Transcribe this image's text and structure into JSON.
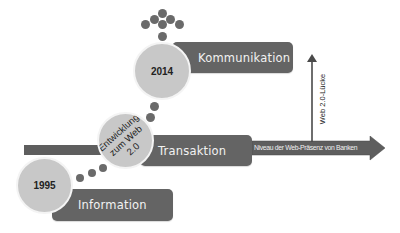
{
  "diagram": {
    "stages": [
      {
        "year": "1995",
        "label": "Information"
      },
      {
        "year": "",
        "label": "Transaktion",
        "circle_text_line1": "Entwicklung",
        "circle_text_line2": "zum Web 2.0"
      },
      {
        "year": "2014",
        "label": "Kommunikation"
      }
    ],
    "horizontal_arrow_label": "Niveau der Web-Präsenz von Banken",
    "vertical_arrow_label": "Web 2.0-Lücke",
    "colors": {
      "box": "#646464",
      "circle": "#c8c8c8",
      "dot": "#6a6a6a",
      "arrow": "#5e5e5e",
      "text_light": "#f2f2f2",
      "text_dark": "#222222"
    }
  }
}
